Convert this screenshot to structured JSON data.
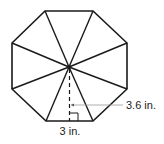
{
  "figure": {
    "shape": "regular octagon",
    "segments": 8,
    "colors": {
      "stroke": "#1a1a1a",
      "leader": "#999999",
      "text": "#222222",
      "background": "#ffffff"
    },
    "vertices": [
      [
        45,
        11
      ],
      [
        93,
        11
      ],
      [
        127,
        43
      ],
      [
        127,
        89
      ],
      [
        93,
        121
      ],
      [
        46,
        121
      ],
      [
        12,
        89
      ],
      [
        12,
        43
      ]
    ],
    "center": [
      69,
      67
    ],
    "labels": {
      "apothem": "3.6 in.",
      "side": "3 in."
    },
    "annotations": {
      "apothem_style": "dashed line with right-angle marker",
      "leader_style": "thin gray leader line pointing to apothem"
    }
  }
}
